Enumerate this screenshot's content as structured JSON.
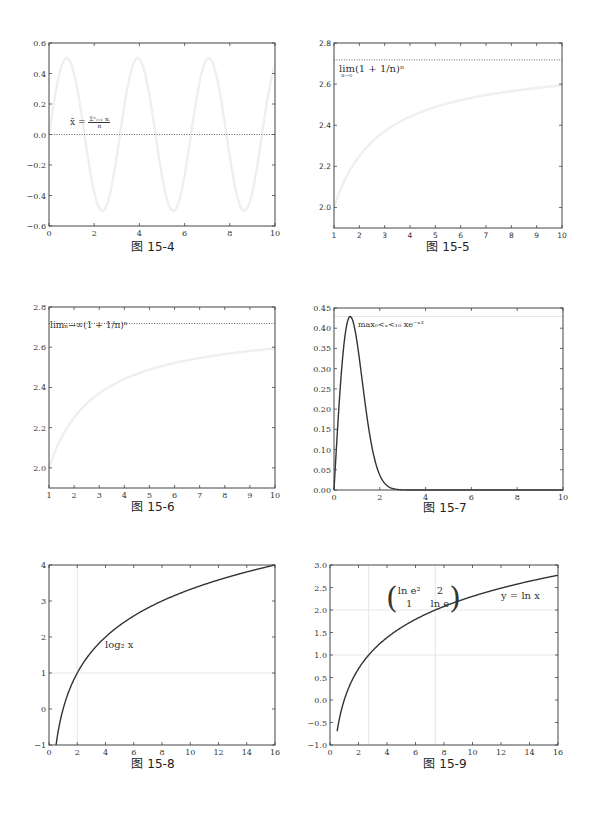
{
  "captions": {
    "fig4": "图 15-4",
    "fig5": "图 15-5",
    "fig6": "图 15-6",
    "fig7": "图 15-7",
    "fig8": "图 15-8",
    "fig9": "图 15-9"
  },
  "annotations": {
    "fig4": "x̄ = Σⁿᵢ₌₁ xᵢ / n",
    "fig4_lhs": "x̄ =",
    "fig4_num": "Σⁿᵢ₌₁ xᵢ",
    "fig4_den": "n",
    "fig5_lim": "lim",
    "fig5_sub": "n→∞",
    "fig5_expr": "(1 + 1/n)ⁿ",
    "fig6": "limₙ→∞(1 + 1/n)ⁿ",
    "fig7": "max₀<ₓ<₁₀ xe⁻ˣ²",
    "fig8": "log₂ x",
    "fig9_matrix_r1c1": "ln e²",
    "fig9_matrix_r1c2": "2",
    "fig9_matrix_r2c1": "1",
    "fig9_matrix_r2c2": "ln e",
    "fig9_label": "y = ln x"
  },
  "chart_data": [
    {
      "id": "fig4",
      "type": "line",
      "title": "图 15-4",
      "xlabel": "",
      "ylabel": "",
      "xlim": [
        0,
        10
      ],
      "ylim": [
        -0.6,
        0.6
      ],
      "xticks": [
        "0",
        "2",
        "4",
        "6",
        "8",
        "10"
      ],
      "yticks": [
        "0.6",
        "0.4",
        "0.2",
        "0.0",
        "−0.2",
        "−0.4",
        "−0.6"
      ],
      "series": [
        {
          "name": "0.5·sin(2x)",
          "style": "solid, very light gray",
          "x": [
            0,
            0.785,
            1.571,
            2.356,
            3.142,
            3.927,
            4.712,
            5.498,
            6.283,
            7.069,
            7.854,
            8.639,
            9.425,
            10
          ],
          "y": [
            0,
            0.5,
            0,
            -0.5,
            0,
            0.5,
            0,
            -0.5,
            0,
            0.5,
            0,
            -0.5,
            0,
            0.456
          ]
        },
        {
          "name": "mean",
          "style": "dotted",
          "x": [
            0,
            10
          ],
          "y": [
            0,
            0
          ]
        }
      ],
      "annotations": [
        "x̄ = Σⁿᵢ₌₁ xᵢ / n"
      ]
    },
    {
      "id": "fig5",
      "type": "line",
      "title": "图 15-5",
      "xlim": [
        1,
        10
      ],
      "ylim": [
        1.9,
        2.8
      ],
      "xticks": [
        "1",
        "2",
        "3",
        "4",
        "5",
        "6",
        "7",
        "8",
        "9",
        "10"
      ],
      "yticks": [
        "2.8",
        "2.6",
        "2.4",
        "2.2",
        "2.0"
      ],
      "series": [
        {
          "name": "(1+1/n)^n",
          "style": "solid, very light gray",
          "x": [
            1,
            2,
            3,
            4,
            5,
            6,
            7,
            8,
            9,
            10
          ],
          "y": [
            2.0,
            2.25,
            2.37,
            2.441,
            2.488,
            2.522,
            2.546,
            2.566,
            2.581,
            2.594
          ]
        },
        {
          "name": "e",
          "style": "dotted",
          "x": [
            1,
            10
          ],
          "y": [
            2.718,
            2.718
          ]
        }
      ],
      "annotations": [
        "lim n→∞ (1 + 1/n)ⁿ"
      ]
    },
    {
      "id": "fig6",
      "type": "line",
      "title": "图 15-6",
      "xlim": [
        1,
        10
      ],
      "ylim": [
        1.9,
        2.8
      ],
      "xticks": [
        "1",
        "2",
        "3",
        "4",
        "5",
        "6",
        "7",
        "8",
        "9",
        "10"
      ],
      "yticks": [
        "2.8",
        "2.6",
        "2.4",
        "2.2",
        "2.0"
      ],
      "series": [
        {
          "name": "(1+1/n)^n",
          "style": "solid, very light gray",
          "x": [
            1,
            2,
            3,
            4,
            5,
            6,
            7,
            8,
            9,
            10
          ],
          "y": [
            2.0,
            2.25,
            2.37,
            2.441,
            2.488,
            2.522,
            2.546,
            2.566,
            2.581,
            2.594
          ]
        },
        {
          "name": "e",
          "style": "dotted",
          "x": [
            1,
            10
          ],
          "y": [
            2.718,
            2.718
          ]
        }
      ],
      "annotations": [
        "limₙ→∞(1 + 1/n)ⁿ"
      ]
    },
    {
      "id": "fig7",
      "type": "line",
      "title": "图 15-7",
      "xlim": [
        0,
        10
      ],
      "ylim": [
        0,
        0.45
      ],
      "xticks": [
        "0",
        "2",
        "4",
        "6",
        "8",
        "10"
      ],
      "yticks": [
        "0.45",
        "0.40",
        "0.35",
        "0.30",
        "0.25",
        "0.20",
        "0.15",
        "0.10",
        "0.05",
        "0.00"
      ],
      "series": [
        {
          "name": "x·e^(-x²)",
          "style": "solid, dark",
          "x": [
            0,
            0.25,
            0.5,
            0.707,
            1.0,
            1.25,
            1.5,
            2.0,
            2.5,
            3.0,
            4.0,
            10.0
          ],
          "y": [
            0,
            0.235,
            0.389,
            0.429,
            0.368,
            0.262,
            0.158,
            0.037,
            0.005,
            0.0004,
            0,
            0
          ]
        },
        {
          "name": "max",
          "style": "solid, very light gray",
          "x": [
            0,
            10
          ],
          "y": [
            0.429,
            0.429
          ]
        }
      ],
      "annotations": [
        "max₀<ₓ<₁₀ xe⁻ˣ²"
      ]
    },
    {
      "id": "fig8",
      "type": "line",
      "title": "图 15-8",
      "xlim": [
        0,
        16
      ],
      "ylim": [
        -1,
        4
      ],
      "xticks": [
        "0",
        "2",
        "4",
        "6",
        "8",
        "10",
        "12",
        "14",
        "16"
      ],
      "yticks": [
        "4",
        "3",
        "2",
        "1",
        "0",
        "−1"
      ],
      "series": [
        {
          "name": "log2(x)",
          "style": "solid, dark",
          "x": [
            0.5,
            1,
            2,
            4,
            6,
            8,
            10,
            12,
            14,
            16
          ],
          "y": [
            -1,
            0,
            1,
            2,
            2.585,
            3,
            3.322,
            3.585,
            3.807,
            4
          ]
        },
        {
          "name": "guide vertical",
          "style": "light gray",
          "x": [
            2,
            2
          ],
          "y": [
            -1,
            4
          ]
        },
        {
          "name": "guide horizontal",
          "style": "light gray",
          "x": [
            0,
            16
          ],
          "y": [
            1,
            1
          ]
        }
      ],
      "annotations": [
        "log₂ x"
      ]
    },
    {
      "id": "fig9",
      "type": "line",
      "title": "图 15-9",
      "xlim": [
        0,
        16
      ],
      "ylim": [
        -1.0,
        3.0
      ],
      "xticks": [
        "0",
        "2",
        "4",
        "6",
        "8",
        "10",
        "12",
        "14",
        "16"
      ],
      "yticks": [
        "3.0",
        "2.5",
        "2.0",
        "1.5",
        "1.0",
        "0.5",
        "0.0",
        "−0.5",
        "−1.0"
      ],
      "series": [
        {
          "name": "ln(x)",
          "style": "solid, dark",
          "x": [
            0.5,
            1,
            2,
            2.718,
            4,
            6,
            7.389,
            8,
            10,
            12,
            14,
            16
          ],
          "y": [
            -0.693,
            0,
            0.693,
            1,
            1.386,
            1.792,
            2,
            2.079,
            2.303,
            2.485,
            2.639,
            2.773
          ]
        },
        {
          "name": "guide x=e",
          "style": "light gray",
          "x": [
            2.718,
            2.718
          ],
          "y": [
            -1,
            3
          ]
        },
        {
          "name": "guide x=e²",
          "style": "light gray",
          "x": [
            7.389,
            7.389
          ],
          "y": [
            -1,
            3
          ]
        },
        {
          "name": "guide y=1",
          "style": "light gray",
          "x": [
            0,
            16
          ],
          "y": [
            1,
            1
          ]
        },
        {
          "name": "guide y=2",
          "style": "light gray",
          "x": [
            0,
            16
          ],
          "y": [
            2,
            2
          ]
        }
      ],
      "annotations": [
        "(ln e²  2 ; 1  ln e)",
        "y = ln x"
      ]
    }
  ]
}
